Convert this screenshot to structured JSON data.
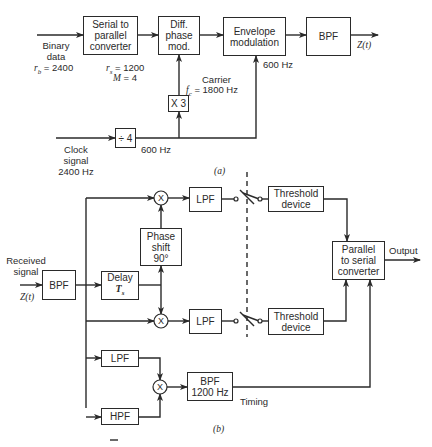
{
  "diagram_a": {
    "caption": "(a)",
    "blocks": {
      "serial_to_parallel": "Serial to\nparallel\nconverter",
      "diff_phase_mod": "Diff.\nphase\nmod.",
      "envelope_mod": "Envelope\nmodulation",
      "bpf": "BPF",
      "times3": "X 3",
      "div4": "÷ 4"
    },
    "labels": {
      "binary_data": "Binary\ndata",
      "rb": "r_b = 2400",
      "rs": "r_s = 1200",
      "m": "M = 4",
      "carrier": "Carrier",
      "fc": "f_c = 1800 Hz",
      "env_600": "600 Hz",
      "div_600": "600 Hz",
      "clock": "Clock\nsignal\n2400 Hz",
      "output": "Z(t)"
    }
  },
  "diagram_b": {
    "caption": "(b)",
    "blocks": {
      "rx_bpf": "BPF",
      "delay": "Delay\nT_s",
      "phase_shift": "Phase\nshift\n90°",
      "lpf_top": "LPF",
      "lpf_bottom": "LPF",
      "threshold_top": "Threshold\ndevice",
      "threshold_bottom": "Threshold\ndevice",
      "p2s": "Parallel\nto serial\nconverter",
      "lpf_timing": "LPF",
      "hpf_timing": "HPF",
      "bpf_timing": "BPF\n1200 Hz"
    },
    "labels": {
      "received": "Received\nsignal",
      "zt": "Z(t)",
      "output": "Output",
      "timing": "Timing",
      "mixer": "X"
    }
  }
}
